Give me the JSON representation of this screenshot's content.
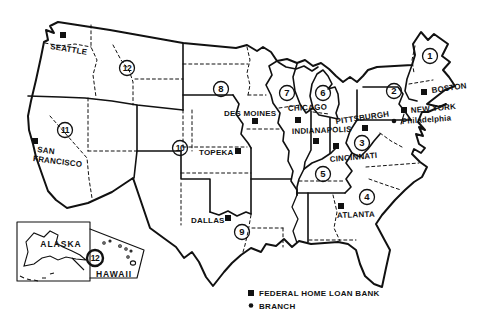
{
  "map": {
    "title": "Federal Home Loan Bank districts map",
    "districts": [
      {
        "number": "1",
        "x": 430,
        "y": 56,
        "bold": false
      },
      {
        "number": "2",
        "x": 394,
        "y": 91,
        "bold": false
      },
      {
        "number": "3",
        "x": 362,
        "y": 143,
        "bold": false
      },
      {
        "number": "4",
        "x": 367,
        "y": 197,
        "bold": false
      },
      {
        "number": "5",
        "x": 323,
        "y": 174,
        "bold": false
      },
      {
        "number": "6",
        "x": 323,
        "y": 93,
        "bold": false
      },
      {
        "number": "7",
        "x": 287,
        "y": 93,
        "bold": false
      },
      {
        "number": "8",
        "x": 221,
        "y": 89,
        "bold": false
      },
      {
        "number": "9",
        "x": 242,
        "y": 232,
        "bold": false
      },
      {
        "number": "10",
        "x": 180,
        "y": 148,
        "bold": false
      },
      {
        "number": "11",
        "x": 65,
        "y": 130,
        "bold": false
      },
      {
        "number": "12",
        "x": 127,
        "y": 68,
        "bold": false
      },
      {
        "number": "12",
        "x": 95,
        "y": 258,
        "bold": true
      }
    ],
    "cities": [
      {
        "lines": [
          "SEATTLE"
        ],
        "type": "bank",
        "x": 50,
        "y": 49,
        "rot": 9,
        "mx": 63,
        "my": 35
      },
      {
        "lines": [
          "SAN",
          "FRANCISCO"
        ],
        "type": "bank",
        "x": 37,
        "y": 152,
        "rot": 7,
        "mx": 35,
        "my": 141
      },
      {
        "lines": [
          "DES MOINES"
        ],
        "type": "bank",
        "x": 224,
        "y": 116,
        "rot": 0,
        "mx": 255,
        "my": 121
      },
      {
        "lines": [
          "TOPEKA"
        ],
        "type": "bank",
        "x": 199,
        "y": 155,
        "rot": 0,
        "mx": 238,
        "my": 151
      },
      {
        "lines": [
          "DALLAS"
        ],
        "type": "bank",
        "x": 191,
        "y": 223,
        "rot": 0,
        "mx": 228,
        "my": 218
      },
      {
        "lines": [
          "CHICAGO"
        ],
        "type": "bank",
        "x": 288,
        "y": 111,
        "rot": -2,
        "mx": 298,
        "my": 120
      },
      {
        "lines": [
          "INDIANAPOLIS"
        ],
        "type": "bank",
        "x": 292,
        "y": 134,
        "rot": -2,
        "mx": 316,
        "my": 141
      },
      {
        "lines": [
          "CINCINNATI"
        ],
        "type": "bank",
        "x": 330,
        "y": 162,
        "rot": -5,
        "mx": 336,
        "my": 146
      },
      {
        "lines": [
          "PITTSBURGH"
        ],
        "type": "bank",
        "x": 336,
        "y": 124,
        "rot": -8,
        "mx": 365,
        "my": 128
      },
      {
        "lines": [
          "ATLANTA"
        ],
        "type": "bank",
        "x": 337,
        "y": 218,
        "rot": -2,
        "mx": 341,
        "my": 206
      },
      {
        "lines": [
          "BOSTON"
        ],
        "type": "bank",
        "x": 432,
        "y": 93,
        "rot": -8,
        "mx": 424,
        "my": 92
      },
      {
        "lines": [
          "NEW YORK"
        ],
        "type": "bank",
        "x": 411,
        "y": 113,
        "rot": -5,
        "mx": 404,
        "my": 110
      },
      {
        "lines": [
          "Philadelphia"
        ],
        "type": "branch",
        "x": 402,
        "y": 124,
        "rot": -4,
        "mx": 394,
        "my": 121
      }
    ],
    "insets": [
      {
        "label": "ALASKA",
        "x": 61,
        "y": 247
      },
      {
        "label": "HAWAII",
        "x": 114,
        "y": 277
      }
    ]
  },
  "legend": {
    "items": [
      {
        "marker": "square",
        "label": "FEDERAL HOME LOAN BANK"
      },
      {
        "marker": "dot",
        "label": "BRANCH"
      }
    ]
  },
  "colors": {
    "ink": "#111111",
    "background": "#ffffff"
  }
}
